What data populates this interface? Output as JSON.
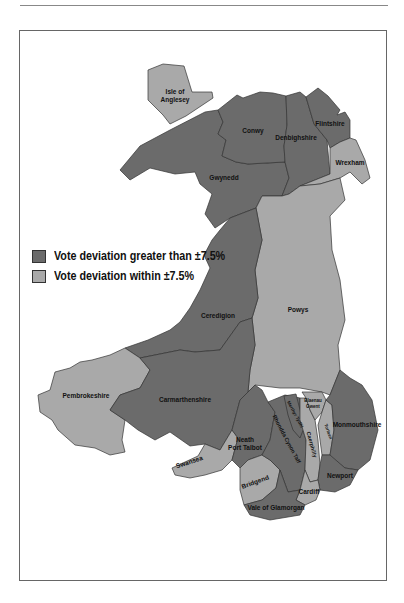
{
  "legend": {
    "items": [
      {
        "label": "Vote deviation greater than ±7.5%",
        "color": "#6b6b6b"
      },
      {
        "label": "Vote deviation within ±7.5%",
        "color": "#a9a9a9"
      }
    ]
  },
  "regions": {
    "anglesey": {
      "name": "Isle of Anglesey",
      "line1": "Isle of",
      "line2": "Anglesey",
      "category": "within"
    },
    "conwy": {
      "name": "Conwy",
      "category": "greater"
    },
    "denbighshire": {
      "name": "Denbighshire",
      "category": "greater"
    },
    "flintshire": {
      "name": "Flintshire",
      "category": "greater"
    },
    "wrexham": {
      "name": "Wrexham",
      "category": "within"
    },
    "gwynedd": {
      "name": "Gwynedd",
      "category": "greater"
    },
    "powys": {
      "name": "Powys",
      "category": "within"
    },
    "ceredigion": {
      "name": "Ceredigion",
      "category": "greater"
    },
    "pembrokeshire": {
      "name": "Pembrokeshire",
      "category": "within"
    },
    "carmarthenshire": {
      "name": "Carmarthenshire",
      "category": "greater"
    },
    "swansea": {
      "name": "Swansea",
      "category": "within"
    },
    "neath": {
      "name": "Neath Port Talbot",
      "line1": "Neath",
      "line2": "Port Talbot",
      "category": "greater"
    },
    "bridgend": {
      "name": "Bridgend",
      "category": "within"
    },
    "rhondda": {
      "name": "Rhondda Cynon Taff",
      "category": "greater"
    },
    "merthyr": {
      "name": "Merthyr Tydfil",
      "category": "greater"
    },
    "caerphilly": {
      "name": "Caerphilly",
      "category": "within"
    },
    "blaenau": {
      "name": "Blaenau Gwent",
      "line1": "Blaenau",
      "line2": "Gwent",
      "category": "within"
    },
    "torfaen": {
      "name": "Torfaen",
      "category": "within"
    },
    "monmouthshire": {
      "name": "Monmouthshire",
      "category": "greater"
    },
    "newport": {
      "name": "Newport",
      "category": "greater"
    },
    "cardiff": {
      "name": "Cardiff",
      "category": "within"
    },
    "vale": {
      "name": "Vale of Glamorgan",
      "category": "greater"
    }
  }
}
